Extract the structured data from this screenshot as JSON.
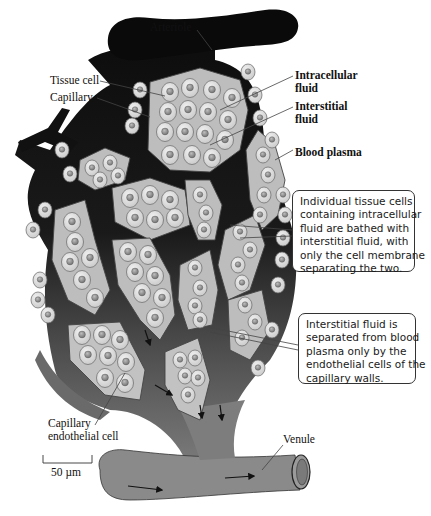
{
  "figure": {
    "type": "biology-diagram",
    "colors": {
      "arteriole": "#0a0a0a",
      "capillary_dark": "#141414",
      "capillary_mid": "#4a4a4a",
      "venule": "#8a8a8a",
      "interstitial": "#bdbdbd",
      "cell_fill": "#dcdcdc",
      "nucleus": "#8e8e8e",
      "background": "#ffffff"
    }
  },
  "labels": {
    "arteriole": "Arteriole",
    "tissue_cell": "Tissue cell",
    "capillary": "Capillary",
    "intracellular_fluid": [
      "Intracellular",
      "fluid"
    ],
    "interstitial_fluid": [
      "Interstitial",
      "fluid"
    ],
    "blood_plasma": "Blood plasma",
    "capillary_endothelial_cell": [
      "Capillary",
      "endothelial cell"
    ],
    "venule": "Venule",
    "scale_bar": "50 µm"
  },
  "callouts": [
    {
      "lines": [
        "Individual tissue cells",
        "containing intracellular",
        "fluid are bathed with",
        "interstitial fluid, with",
        "only the cell membrane",
        "separating the two."
      ]
    },
    {
      "lines": [
        "Interstitial fluid is",
        "separated from blood",
        "plasma only by the",
        "endothelial cells of the",
        "capillary walls."
      ]
    }
  ]
}
